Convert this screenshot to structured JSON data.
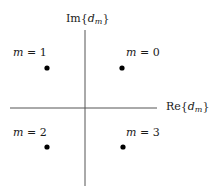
{
  "diagram": {
    "axes": {
      "horizontal": {
        "label_prefix": "Re{",
        "label_var": "d",
        "label_sub": "m",
        "label_suffix": "}"
      },
      "vertical": {
        "label_prefix": "Im{",
        "label_var": "d",
        "label_sub": "m",
        "label_suffix": "}"
      }
    },
    "points": [
      {
        "label_var": "m",
        "label_eq": " = ",
        "label_val": "0",
        "quadrant": "I"
      },
      {
        "label_var": "m",
        "label_eq": " = ",
        "label_val": "1",
        "quadrant": "II"
      },
      {
        "label_var": "m",
        "label_eq": " = ",
        "label_val": "2",
        "quadrant": "III"
      },
      {
        "label_var": "m",
        "label_eq": " = ",
        "label_val": "3",
        "quadrant": "IV"
      }
    ],
    "colors": {
      "axis": "#555555",
      "point": "#000000",
      "text": "#1a1a1a"
    }
  }
}
